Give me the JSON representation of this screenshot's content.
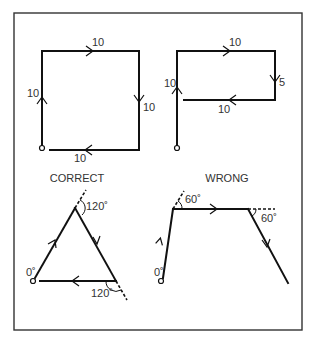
{
  "figure": {
    "panels": {
      "square": {
        "segments": [
          {
            "label": "10",
            "direction": "up"
          },
          {
            "label": "10",
            "direction": "right"
          },
          {
            "label": "10",
            "direction": "down"
          },
          {
            "label": "10",
            "direction": "left"
          }
        ]
      },
      "rectangle_path": {
        "segments": [
          {
            "label": "10",
            "direction": "up"
          },
          {
            "label": "10",
            "direction": "right"
          },
          {
            "label": "5",
            "direction": "down"
          },
          {
            "label": "10",
            "direction": "left"
          }
        ]
      },
      "correct": {
        "title": "CORRECT",
        "start_angle_label": "0˚",
        "top_angle_label": "120˚",
        "bottom_angle_label": "120˚"
      },
      "wrong": {
        "title": "WRONG",
        "start_angle_label": "0˚",
        "left_angle_label": "60˚",
        "right_angle_label": "60˚"
      }
    }
  }
}
